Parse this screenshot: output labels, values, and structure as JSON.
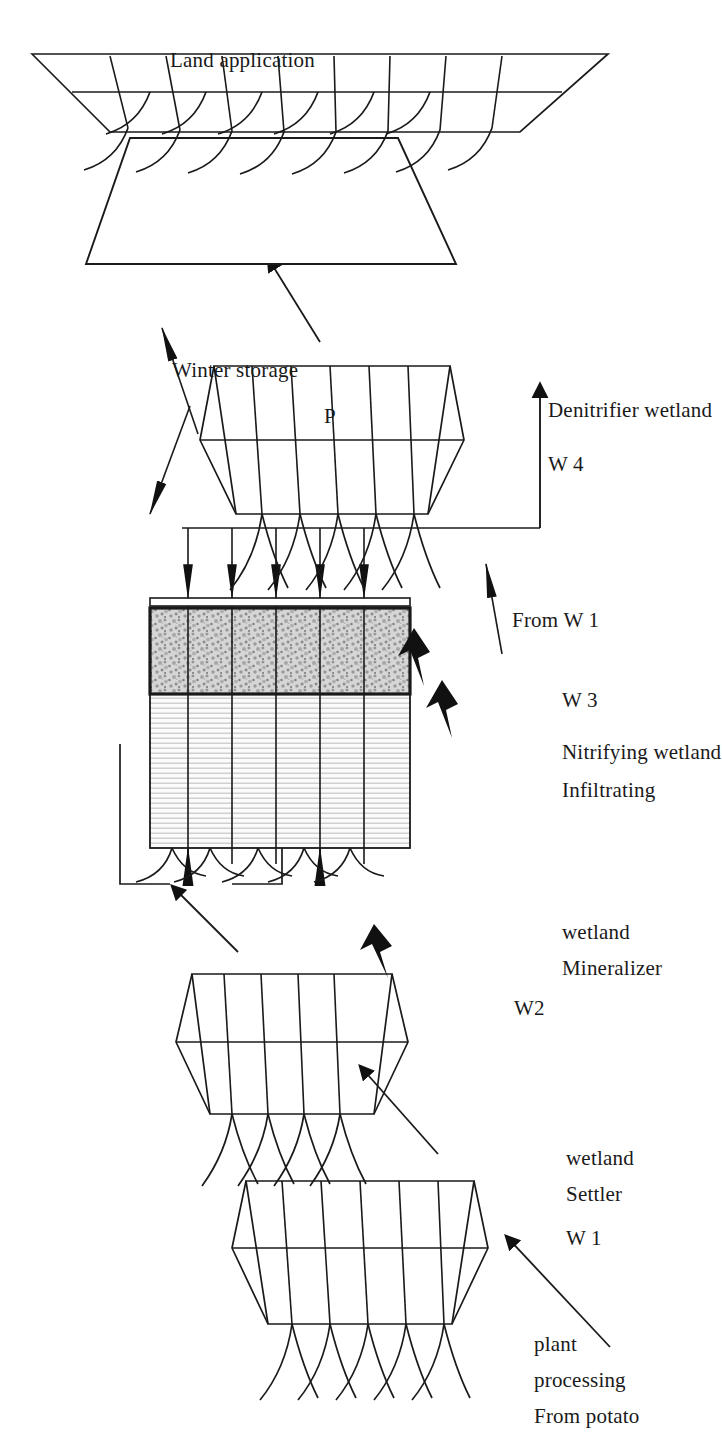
{
  "figure": {
    "orientation": "rotated-90-ccw",
    "background_color": "#ffffff",
    "ink_color": "#1a1a1a",
    "gravel_fill_color": "#c9c9c9",
    "reedbed_fill_color": "#f2f2f2"
  },
  "labels": {
    "source": "From potato\nprocessing\nplant",
    "source_line1": "From potato",
    "source_line2": "processing",
    "source_line3": "plant",
    "w1_code": "W 1",
    "w1_name_line1": "Settler",
    "w1_name_line2": "wetland",
    "w2_code": "W2",
    "w2_name_line1": "Mineralizer",
    "w2_name_line2": "wetland",
    "w3_code": "W 3",
    "w3_name_line1": "Infiltrating",
    "w3_name_line2": "Nitrifying wetland",
    "w4_code": "W 4",
    "w4_name": "Denitrifier wetland",
    "from_w1": "From W 1",
    "winter_storage": "Winter storage",
    "land_application": "Land application",
    "p_marker": "P"
  },
  "nodes": [
    {
      "id": "w1",
      "code": "W 1",
      "name": "Settler wetland",
      "kind": "planted-basin"
    },
    {
      "id": "w2",
      "code": "W2",
      "name": "Mineralizer wetland",
      "kind": "planted-basin"
    },
    {
      "id": "w3",
      "code": "W 3",
      "name": "Infiltrating Nitrifying wetland",
      "kind": "section-bed"
    },
    {
      "id": "w4",
      "code": "W 4",
      "name": "Denitrifier wetland",
      "kind": "planted-basin"
    },
    {
      "id": "storage",
      "code": "",
      "name": "Winter storage",
      "kind": "pond"
    },
    {
      "id": "land",
      "code": "",
      "name": "Land application",
      "kind": "crop-field"
    }
  ],
  "flows": [
    {
      "from": "potato processing plant",
      "to": "W 1",
      "label": "From potato processing plant",
      "style": "thin-arrow"
    },
    {
      "from": "W 1",
      "to": "W 2",
      "label": "",
      "style": "thin-arrow"
    },
    {
      "from": "W 2",
      "to": "W 3",
      "label": "",
      "style": "thick-arrow"
    },
    {
      "from": "W 2",
      "to": "W 3 inflow",
      "label": "",
      "style": "thin-arrow"
    },
    {
      "from": "W 3",
      "to": "W 4",
      "label": "",
      "style": "thin-arrow"
    },
    {
      "from": "W 1",
      "to": "W 4",
      "label": "From W 1",
      "style": "solid-head-arrow"
    },
    {
      "from": "W 4",
      "to": "Winter storage",
      "label": "",
      "style": "solid-head-arrow"
    },
    {
      "from": "Winter storage",
      "to": "Land application",
      "label": "P",
      "style": "solid-head-arrow"
    },
    {
      "from": "W 4",
      "to": "Land application",
      "label": "",
      "style": "thin-arrow"
    }
  ]
}
